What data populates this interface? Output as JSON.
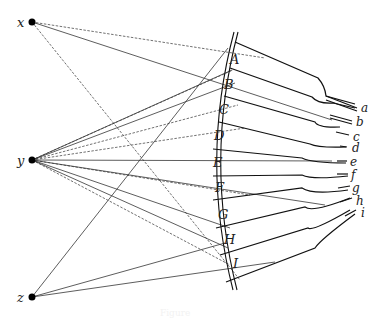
{
  "diagram": {
    "caption": "Figure",
    "source_points": [
      {
        "id": "x",
        "label": "x",
        "cx": 32,
        "cy": 22
      },
      {
        "id": "y",
        "label": "y",
        "cx": 32,
        "cy": 160
      },
      {
        "id": "z",
        "label": "z",
        "cx": 32,
        "cy": 297
      }
    ],
    "facets": [
      "A",
      "B",
      "C",
      "D",
      "E",
      "F",
      "G",
      "H",
      "I"
    ],
    "receptors": [
      "a",
      "b",
      "c",
      "d",
      "e",
      "f",
      "g",
      "h",
      "i"
    ],
    "connections": [
      {
        "from": "x",
        "to": "A",
        "style": "dashed"
      },
      {
        "from": "x",
        "to": "B",
        "style": "solid"
      },
      {
        "from": "x",
        "to": "I",
        "style": "dashed"
      },
      {
        "from": "y",
        "to": "A",
        "style": "dashed"
      },
      {
        "from": "y",
        "to": "B",
        "style": "solid"
      },
      {
        "from": "y",
        "to": "C",
        "style": "dashed"
      },
      {
        "from": "y",
        "to": "D",
        "style": "dashed"
      },
      {
        "from": "y",
        "to": "E",
        "style": "solid"
      },
      {
        "from": "y",
        "to": "F",
        "style": "dashed"
      },
      {
        "from": "y",
        "to": "G",
        "style": "solid"
      },
      {
        "from": "y",
        "to": "H",
        "style": "solid"
      },
      {
        "from": "y",
        "to": "I",
        "style": "dashed"
      },
      {
        "from": "z",
        "to": "A",
        "style": "solid"
      },
      {
        "from": "z",
        "to": "H",
        "style": "solid"
      },
      {
        "from": "z",
        "to": "I",
        "style": "solid"
      }
    ],
    "colors": {
      "ink": "#111111",
      "background": "#ffffff"
    }
  }
}
